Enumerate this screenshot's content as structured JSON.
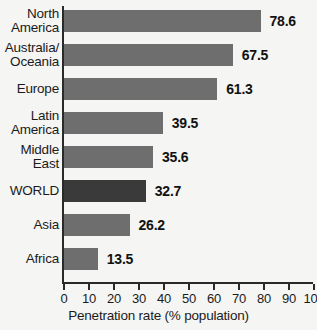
{
  "chart_data": {
    "type": "bar",
    "orientation": "horizontal",
    "title": "",
    "xlabel": "Penetration rate (% population)",
    "ylabel": "",
    "xlim": [
      0,
      100
    ],
    "grid": false,
    "legend": null,
    "xticks": [
      0,
      10,
      20,
      30,
      40,
      50,
      60,
      70,
      80,
      90,
      100
    ],
    "xtick_labels": [
      "0",
      "10",
      "20",
      "30",
      "40",
      "50",
      "60",
      "70",
      "80",
      "90",
      "100"
    ],
    "categories": [
      "North\nAmerica",
      "Australia/\nOceania",
      "Europe",
      "Latin\nAmerica",
      "Middle\nEast",
      "WORLD",
      "Asia",
      "Africa"
    ],
    "values": [
      78.6,
      67.5,
      61.3,
      39.5,
      35.6,
      32.7,
      26.2,
      13.5
    ],
    "value_labels": [
      "78.6",
      "67.5",
      "61.3",
      "39.5",
      "35.6",
      "32.7",
      "26.2",
      "13.5"
    ],
    "highlight_index": 5,
    "colors": {
      "bar": "#6e6e6e",
      "bar_highlight": "#3a3a3a",
      "axis": "#2a2a2a",
      "text": "#1b1b1b",
      "background": "#f5f5f3"
    }
  }
}
